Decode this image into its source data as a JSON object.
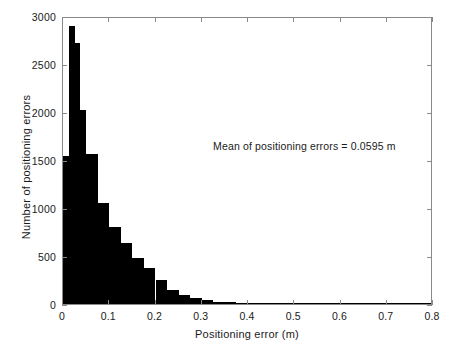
{
  "chart_data": {
    "type": "bar",
    "title": "",
    "xlabel": "Positioning error (m)",
    "ylabel": "Number of positioning errors",
    "xlim": [
      0,
      0.8
    ],
    "ylim": [
      0,
      3000
    ],
    "grid": false,
    "legend": null,
    "bar_color": "#000000",
    "axis_color": "#8a8a8a",
    "bin_width": 0.0125,
    "xticks": [
      0,
      0.1,
      0.2,
      0.3,
      0.4,
      0.5,
      0.6,
      0.7,
      0.8
    ],
    "xtick_labels": [
      "0",
      "0.1",
      "0.2",
      "0.3",
      "0.4",
      "0.5",
      "0.6",
      "0.7",
      "0.8"
    ],
    "yticks": [
      0,
      500,
      1000,
      1500,
      2000,
      2500,
      3000
    ],
    "ytick_labels": [
      "0",
      "500",
      "1000",
      "1500",
      "2000",
      "2500",
      "3000"
    ],
    "annotations": [
      {
        "text": "Mean of positioning errors = 0.0595 m",
        "x": 0.33,
        "y": 1680
      }
    ],
    "bin_centers": [
      0.00625,
      0.01875,
      0.03125,
      0.04375,
      0.05625,
      0.06875,
      0.08125,
      0.09375,
      0.10625,
      0.11875,
      0.13125,
      0.14375,
      0.15625,
      0.16875,
      0.18125,
      0.19375,
      0.20625,
      0.21875,
      0.23125,
      0.24375,
      0.25625,
      0.26875,
      0.28125,
      0.29375,
      0.30625,
      0.31875,
      0.33125,
      0.34375,
      0.35625,
      0.36875,
      0.38125,
      0.39375,
      0.40625,
      0.41875,
      0.43125,
      0.44375,
      0.45625,
      0.46875,
      0.48125,
      0.49375,
      0.50625,
      0.51875,
      0.53125,
      0.54375,
      0.55625,
      0.56875,
      0.58125,
      0.59375,
      0.60625,
      0.61875,
      0.63125,
      0.64375,
      0.65625,
      0.66875,
      0.68125,
      0.69375,
      0.70625,
      0.71875,
      0.73125,
      0.74375,
      0.75625,
      0.76875,
      0.78125,
      0.79375
    ],
    "values": [
      1540,
      2900,
      2720,
      2020,
      1560,
      1560,
      1050,
      1050,
      800,
      800,
      640,
      640,
      480,
      480,
      370,
      370,
      250,
      250,
      150,
      150,
      95,
      95,
      60,
      60,
      38,
      38,
      22,
      22,
      16,
      16,
      12,
      12,
      9,
      9,
      7,
      7,
      6,
      6,
      5,
      5,
      4,
      4,
      10,
      10,
      3,
      3,
      2,
      2,
      2,
      2,
      2,
      2,
      1,
      1,
      1,
      1,
      8,
      8,
      6,
      6,
      1,
      1,
      1,
      1
    ]
  }
}
